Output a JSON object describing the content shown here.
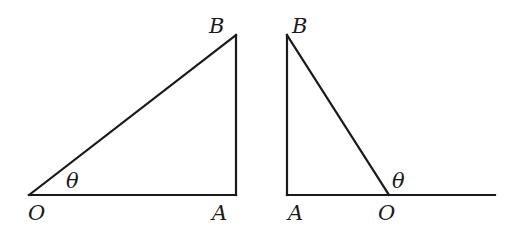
{
  "figures": [
    {
      "name": "left-triangle",
      "points": {
        "O": [
          29,
          195
        ],
        "A": [
          236,
          195
        ],
        "B": [
          236,
          35
        ]
      },
      "segments": [
        [
          "O",
          "A"
        ],
        [
          "A",
          "B"
        ],
        [
          "O",
          "B"
        ]
      ],
      "labels": {
        "O": "O",
        "A": "A",
        "B": "B",
        "theta": "θ"
      },
      "label_positions": {
        "O": [
          28,
          220
        ],
        "A": [
          212,
          220
        ],
        "B": [
          209,
          33
        ],
        "theta": [
          66,
          188
        ]
      }
    },
    {
      "name": "right-triangle",
      "points": {
        "A": [
          287,
          195
        ],
        "B": [
          287,
          35
        ],
        "O": [
          389,
          195
        ],
        "E": [
          495,
          195
        ]
      },
      "segments": [
        [
          "A",
          "O"
        ],
        [
          "O",
          "E"
        ],
        [
          "A",
          "B"
        ],
        [
          "B",
          "O"
        ]
      ],
      "labels": {
        "A": "A",
        "O": "O",
        "B": "B",
        "theta": "θ"
      },
      "label_positions": {
        "A": [
          288,
          220
        ],
        "O": [
          378,
          220
        ],
        "B": [
          292,
          33
        ],
        "theta": [
          392,
          188
        ]
      }
    }
  ]
}
